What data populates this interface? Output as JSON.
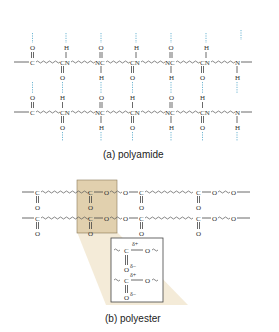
{
  "header": {
    "text": ""
  },
  "polyamide": {
    "caption": "(a) polyamide",
    "row1": [
      "C",
      "CN",
      "NC",
      "CN",
      "NC",
      "CN",
      "N"
    ],
    "row2": [
      "C",
      "CN",
      "NC",
      "CN",
      "NC",
      "CN",
      "N"
    ]
  },
  "polyester": {
    "caption": "(b) polyester",
    "row1": [
      "C",
      "C",
      "O",
      "O",
      "C",
      "C",
      "O",
      "O"
    ],
    "row2": [
      "C",
      "C",
      "O",
      "O",
      "C",
      "C",
      "O",
      "O"
    ],
    "inset": {
      "delta_plus": "δ+",
      "delta_minus": "δ−",
      "carbon": "C",
      "oxygen": "O"
    }
  },
  "colors": {
    "hydrogen_bond": "#4aa3c8",
    "highlight": "#d9c49a"
  }
}
